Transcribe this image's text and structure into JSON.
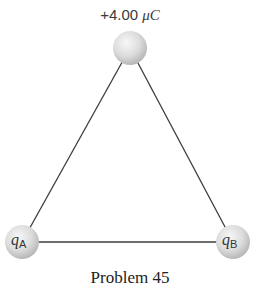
{
  "diagram": {
    "type": "equilateral triangle of point charges",
    "top_charge": {
      "label": "+4.00",
      "unit": "μC"
    },
    "charge_a": {
      "symbol": "q",
      "subscript": "A"
    },
    "charge_b": {
      "symbol": "q",
      "subscript": "B"
    },
    "caption": "Problem 45",
    "colors": {
      "line": "#3c3c3c",
      "sphere_light": "#f4f4f4",
      "sphere_dark": "#bdbdbd",
      "text": "#333333"
    }
  }
}
